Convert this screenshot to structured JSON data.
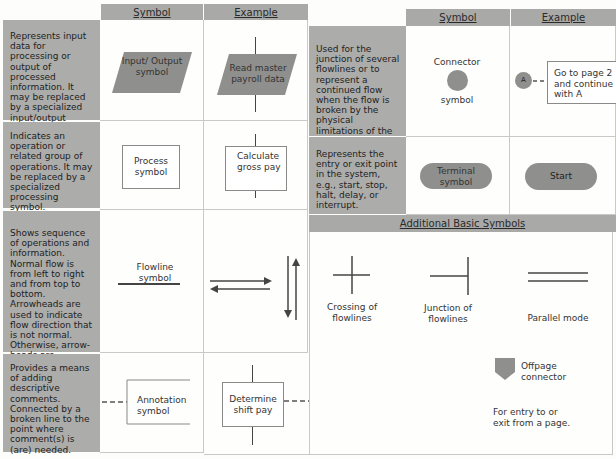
{
  "left_table": {
    "headers": {
      "symbol": "Symbol",
      "example": "Example"
    },
    "rows": [
      {
        "description": "Represents input data for processing or output of processed information. It may be replaced by a specialized input/output symbol.",
        "symbol_label": "Input/ Output symbol",
        "example_label": "Read master payroll data"
      },
      {
        "description": "Indicates an operation or related group of operations. It may be replaced by a specialized processing symbol.",
        "symbol_label": "Process symbol",
        "example_label": "Calculate gross pay"
      },
      {
        "description": "Shows sequence of operations and information. Normal flow is from left to right and from top to bottom. Arrowheads are used to indicate flow direction that is not normal. Otherwise, arrow-heads are optional.",
        "symbol_label": "Flowline symbol",
        "example_label": ""
      },
      {
        "description": "Provides a means of adding descriptive comments. Connected by a broken line to the point where comment(s) is (are) needed.",
        "symbol_label": "Annotation symbol",
        "example_label": "Determine shift pay",
        "example_note_1": "1st shift – no extra shift pay",
        "example_note_2": "2nd shift – $.10/hour shift pay"
      }
    ]
  },
  "right_table": {
    "headers": {
      "symbol": "Symbol",
      "example": "Example"
    },
    "rows": [
      {
        "description": "Used for the junction of several flowlines or to represent a continued flow when the flow is broken by the physical limitations of the flowchart.",
        "symbol_label_top": "Connector",
        "symbol_label_bottom": "symbol",
        "example_circle_letter": "A",
        "example_note": "Go to page 2 and continue with A"
      },
      {
        "description": "Represents the entry or exit point in the system, e.g., start, stop, halt, delay, or interrupt.",
        "symbol_label": "Terminal symbol",
        "example_label": "Start"
      }
    ]
  },
  "additional": {
    "title": "Additional Basic Symbols",
    "items": [
      {
        "label": "Crossing of flowlines"
      },
      {
        "label": "Junction of flowlines"
      },
      {
        "label": "Parallel mode"
      },
      {
        "label": "Offpage connector",
        "note": "For entry to or exit from a page."
      }
    ]
  },
  "colors": {
    "header_gray": "#a9a9a7",
    "desc_gray": "#acacaa",
    "symbol_gray": "#8f8f8d",
    "line": "#444444"
  }
}
